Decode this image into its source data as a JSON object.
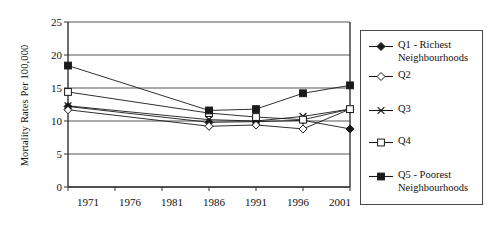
{
  "chart_data": {
    "type": "line",
    "title": "",
    "xlabel": "",
    "ylabel": "Mortality Rates Per 100,000",
    "categories": [
      "1971",
      "1976",
      "1981",
      "1986",
      "1991",
      "1996",
      "2001"
    ],
    "x": [
      1971,
      1976,
      1981,
      1986,
      1991,
      1996,
      2001
    ],
    "ylim": [
      0,
      25
    ],
    "yticks": [
      0,
      5,
      10,
      15,
      20,
      25
    ],
    "ytick_labels": [
      "0",
      "5",
      "10",
      "15",
      "20",
      "25"
    ],
    "grid": "horizontal",
    "legend_position": "right-outside",
    "series": [
      {
        "name": "Q1 - Richest Neighbourhoods",
        "marker": "filled-diamond",
        "x": [
          1971,
          1986,
          1991,
          1996,
          2001
        ],
        "values": [
          12.2,
          9.8,
          9.9,
          10.1,
          8.8
        ]
      },
      {
        "name": "Q2",
        "marker": "open-diamond",
        "x": [
          1971,
          1986,
          1991,
          1996,
          2001
        ],
        "values": [
          11.7,
          9.2,
          9.4,
          8.8,
          11.8
        ]
      },
      {
        "name": "Q3",
        "marker": "x-cross",
        "x": [
          1971,
          1986,
          1991,
          1996,
          2001
        ],
        "values": [
          12.3,
          10.2,
          10.0,
          10.7,
          11.8
        ]
      },
      {
        "name": "Q4",
        "marker": "open-square",
        "x": [
          1971,
          1986,
          1991,
          1996,
          2001
        ],
        "values": [
          14.4,
          11.2,
          10.6,
          10.2,
          11.8
        ]
      },
      {
        "name": "Q5 - Poorest Neighbourhoods",
        "marker": "filled-square",
        "x": [
          1971,
          1986,
          1991,
          1996,
          2001
        ],
        "values": [
          18.4,
          11.6,
          11.8,
          14.2,
          15.4
        ]
      }
    ]
  },
  "axis": {
    "y_title": "Mortality Rates Per 100,000",
    "y_ticks": [
      "25",
      "20",
      "15",
      "10",
      "5",
      "0"
    ],
    "x_ticks": [
      "1971",
      "1976",
      "1981",
      "1986",
      "1991",
      "1996",
      "2001"
    ]
  },
  "legend": {
    "items": [
      {
        "label": "Q1 - Richest\nNeighbourhoods",
        "marker": "filled-diamond"
      },
      {
        "label": "Q2",
        "marker": "open-diamond"
      },
      {
        "label": "Q3",
        "marker": "x-cross"
      },
      {
        "label": "Q4",
        "marker": "open-square"
      },
      {
        "label": "Q5 - Poorest\nNeighbourhoods",
        "marker": "filled-square"
      }
    ]
  },
  "colors": {
    "line": "#1a1a1a",
    "grid": "#555555",
    "axis": "#333333",
    "background": "#ffffff"
  }
}
